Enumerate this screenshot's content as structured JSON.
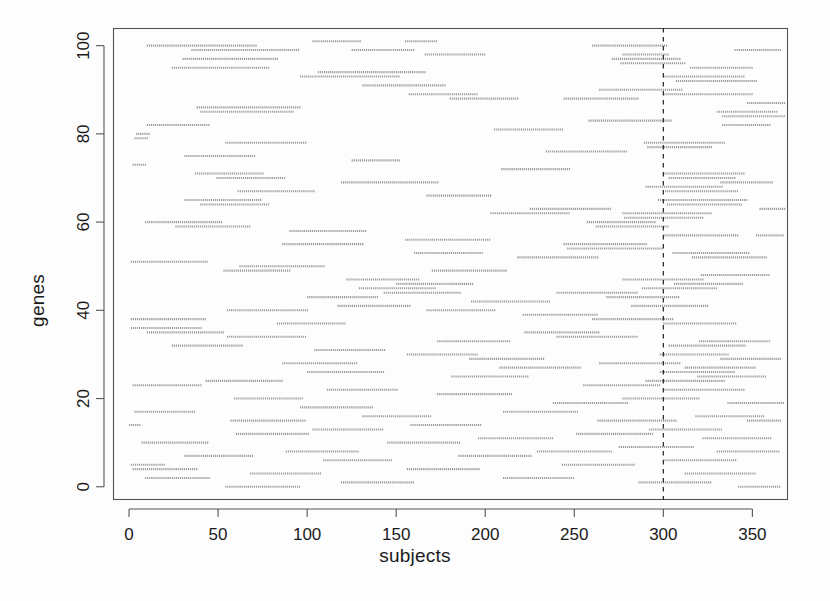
{
  "figure": {
    "background_color": "#fdfdfd",
    "plot_area": {
      "left": 113,
      "top": 28,
      "right": 788,
      "bottom": 500
    },
    "box_color": "#555555",
    "point_color": "#9a9a9a",
    "refline_color": "#222222"
  },
  "axes": {
    "x_title": "subjects",
    "y_title": "genes"
  },
  "chart_data": {
    "type": "scatter",
    "title": "",
    "xlabel": "subjects",
    "ylabel": "genes",
    "xlim": [
      -9,
      370
    ],
    "ylim": [
      -3,
      104
    ],
    "grid": false,
    "legend": null,
    "xticks": [
      0,
      50,
      100,
      150,
      200,
      250,
      300,
      350
    ],
    "yticks": [
      0,
      20,
      40,
      60,
      80,
      100
    ],
    "xtick_labels": [
      "0",
      "50",
      "100",
      "150",
      "200",
      "250",
      "300",
      "350"
    ],
    "ytick_labels": [
      "0",
      "20",
      "40",
      "60",
      "80",
      "100"
    ],
    "marker": "dense-dot-run",
    "marker_size": 1.1,
    "point_color": "#9a9a9a",
    "annotations": [
      {
        "type": "vline",
        "x": 300,
        "style": "dashed",
        "color": "#222222",
        "label": "reference line at subject 300"
      }
    ],
    "series": [
      {
        "name": "gene runs",
        "note": "Each entry: [gene (y), subject start (x0), subject end (x1)]",
        "runs": [
          [
            101,
            103,
            130
          ],
          [
            101,
            155,
            173
          ],
          [
            100,
            10,
            72
          ],
          [
            100,
            260,
            302
          ],
          [
            99,
            35,
            95
          ],
          [
            99,
            125,
            160
          ],
          [
            99,
            340,
            366
          ],
          [
            98,
            166,
            200
          ],
          [
            98,
            277,
            303
          ],
          [
            97,
            30,
            83
          ],
          [
            97,
            271,
            309
          ],
          [
            96,
            276,
            312
          ],
          [
            95,
            24,
            79
          ],
          [
            95,
            315,
            350
          ],
          [
            94,
            106,
            166
          ],
          [
            93,
            96,
            152
          ],
          [
            93,
            300,
            345
          ],
          [
            92,
            307,
            352
          ],
          [
            91,
            131,
            178
          ],
          [
            90,
            264,
            311
          ],
          [
            89,
            157,
            196
          ],
          [
            89,
            300,
            350
          ],
          [
            88,
            180,
            219
          ],
          [
            88,
            244,
            286
          ],
          [
            87,
            347,
            368
          ],
          [
            86,
            38,
            96
          ],
          [
            85,
            40,
            92
          ],
          [
            85,
            330,
            364
          ],
          [
            84,
            333,
            368
          ],
          [
            83,
            258,
            305
          ],
          [
            82,
            10,
            45
          ],
          [
            82,
            333,
            360
          ],
          [
            81,
            205,
            243
          ],
          [
            80,
            4,
            12
          ],
          [
            79,
            3,
            11
          ],
          [
            78,
            54,
            100
          ],
          [
            78,
            289,
            334
          ],
          [
            77,
            291,
            327
          ],
          [
            76,
            234,
            279
          ],
          [
            75,
            31,
            71
          ],
          [
            74,
            125,
            152
          ],
          [
            73,
            2,
            9
          ],
          [
            72,
            209,
            247
          ],
          [
            71,
            37,
            75
          ],
          [
            71,
            300,
            345
          ],
          [
            70,
            49,
            88
          ],
          [
            70,
            303,
            340
          ],
          [
            69,
            119,
            174
          ],
          [
            69,
            332,
            361
          ],
          [
            68,
            290,
            333
          ],
          [
            67,
            61,
            104
          ],
          [
            67,
            301,
            342
          ],
          [
            66,
            167,
            203
          ],
          [
            65,
            31,
            74
          ],
          [
            65,
            297,
            347
          ],
          [
            64,
            40,
            78
          ],
          [
            64,
            302,
            344
          ],
          [
            63,
            225,
            270
          ],
          [
            63,
            354,
            368
          ],
          [
            62,
            203,
            247
          ],
          [
            62,
            277,
            327
          ],
          [
            61,
            278,
            322
          ],
          [
            60,
            9,
            52
          ],
          [
            60,
            257,
            295
          ],
          [
            59,
            26,
            68
          ],
          [
            59,
            262,
            303
          ],
          [
            58,
            90,
            133
          ],
          [
            57,
            300,
            342
          ],
          [
            57,
            352,
            368
          ],
          [
            56,
            155,
            203
          ],
          [
            55,
            86,
            132
          ],
          [
            55,
            244,
            291
          ],
          [
            54,
            246,
            300
          ],
          [
            53,
            160,
            198
          ],
          [
            53,
            305,
            348
          ],
          [
            52,
            218,
            264
          ],
          [
            52,
            316,
            358
          ],
          [
            51,
            1,
            44
          ],
          [
            50,
            62,
            110
          ],
          [
            49,
            53,
            90
          ],
          [
            49,
            170,
            212
          ],
          [
            48,
            321,
            360
          ],
          [
            47,
            122,
            163
          ],
          [
            47,
            277,
            322
          ],
          [
            46,
            150,
            193
          ],
          [
            46,
            306,
            345
          ],
          [
            45,
            129,
            172
          ],
          [
            45,
            288,
            330
          ],
          [
            44,
            143,
            186
          ],
          [
            44,
            240,
            286
          ],
          [
            43,
            100,
            140
          ],
          [
            43,
            268,
            309
          ],
          [
            42,
            192,
            236
          ],
          [
            41,
            117,
            158
          ],
          [
            41,
            282,
            325
          ],
          [
            40,
            55,
            100
          ],
          [
            40,
            167,
            205
          ],
          [
            39,
            221,
            263
          ],
          [
            38,
            1,
            43
          ],
          [
            38,
            260,
            305
          ],
          [
            37,
            83,
            122
          ],
          [
            37,
            300,
            341
          ],
          [
            36,
            1,
            41
          ],
          [
            35,
            10,
            53
          ],
          [
            35,
            222,
            264
          ],
          [
            34,
            55,
            99
          ],
          [
            34,
            240,
            286
          ],
          [
            33,
            173,
            214
          ],
          [
            33,
            320,
            360
          ],
          [
            32,
            24,
            64
          ],
          [
            32,
            303,
            346
          ],
          [
            31,
            104,
            144
          ],
          [
            30,
            156,
            196
          ],
          [
            30,
            298,
            337
          ],
          [
            29,
            191,
            233
          ],
          [
            29,
            332,
            366
          ],
          [
            28,
            86,
            128
          ],
          [
            28,
            264,
            309
          ],
          [
            27,
            208,
            253
          ],
          [
            27,
            312,
            352
          ],
          [
            26,
            100,
            143
          ],
          [
            26,
            298,
            340
          ],
          [
            25,
            181,
            224
          ],
          [
            25,
            319,
            358
          ],
          [
            24,
            43,
            86
          ],
          [
            24,
            290,
            334
          ],
          [
            23,
            2,
            40
          ],
          [
            23,
            255,
            298
          ],
          [
            22,
            111,
            151
          ],
          [
            22,
            300,
            345
          ],
          [
            21,
            173,
            215
          ],
          [
            20,
            59,
            98
          ],
          [
            20,
            277,
            320
          ],
          [
            19,
            238,
            280
          ],
          [
            19,
            336,
            368
          ],
          [
            18,
            96,
            137
          ],
          [
            17,
            3,
            37
          ],
          [
            17,
            210,
            252
          ],
          [
            16,
            131,
            170
          ],
          [
            16,
            318,
            356
          ],
          [
            15,
            57,
            99
          ],
          [
            15,
            263,
            307
          ],
          [
            15,
            347,
            366
          ],
          [
            14,
            0,
            6
          ],
          [
            14,
            158,
            198
          ],
          [
            13,
            103,
            143
          ],
          [
            13,
            292,
            333
          ],
          [
            12,
            60,
            101
          ],
          [
            12,
            251,
            294
          ],
          [
            11,
            196,
            238
          ],
          [
            11,
            322,
            360
          ],
          [
            10,
            7,
            44
          ],
          [
            10,
            145,
            186
          ],
          [
            9,
            275,
            317
          ],
          [
            8,
            88,
            129
          ],
          [
            8,
            229,
            271
          ],
          [
            8,
            330,
            365
          ],
          [
            7,
            31,
            70
          ],
          [
            7,
            185,
            226
          ],
          [
            6,
            109,
            148
          ],
          [
            6,
            300,
            341
          ],
          [
            5,
            1,
            20
          ],
          [
            5,
            243,
            284
          ],
          [
            4,
            2,
            38
          ],
          [
            4,
            156,
            197
          ],
          [
            3,
            68,
            108
          ],
          [
            3,
            312,
            352
          ],
          [
            2,
            9,
            45
          ],
          [
            2,
            210,
            250
          ],
          [
            1,
            119,
            160
          ],
          [
            1,
            286,
            327
          ],
          [
            0,
            54,
            96
          ],
          [
            0,
            342,
            366
          ]
        ]
      }
    ]
  }
}
